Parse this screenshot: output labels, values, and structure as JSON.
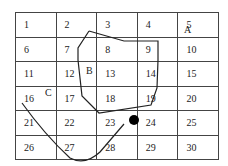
{
  "grid": {
    "rows": 6,
    "cols": 5,
    "cells": [
      [
        "1",
        "2",
        "3",
        "4",
        "5"
      ],
      [
        "6",
        "7",
        "8",
        "9",
        "10"
      ],
      [
        "11",
        "12",
        "13",
        "14",
        "15"
      ],
      [
        "16",
        "17",
        "18",
        "19",
        "20"
      ],
      [
        "21",
        "22",
        "23",
        "24",
        "25"
      ],
      [
        "26",
        "27",
        "28",
        "29",
        "30"
      ]
    ]
  },
  "labels": {
    "a": "A",
    "b": "B",
    "c": "C"
  },
  "colors": {
    "line": "#222222",
    "grid": "#444444",
    "dot": "#000000"
  }
}
